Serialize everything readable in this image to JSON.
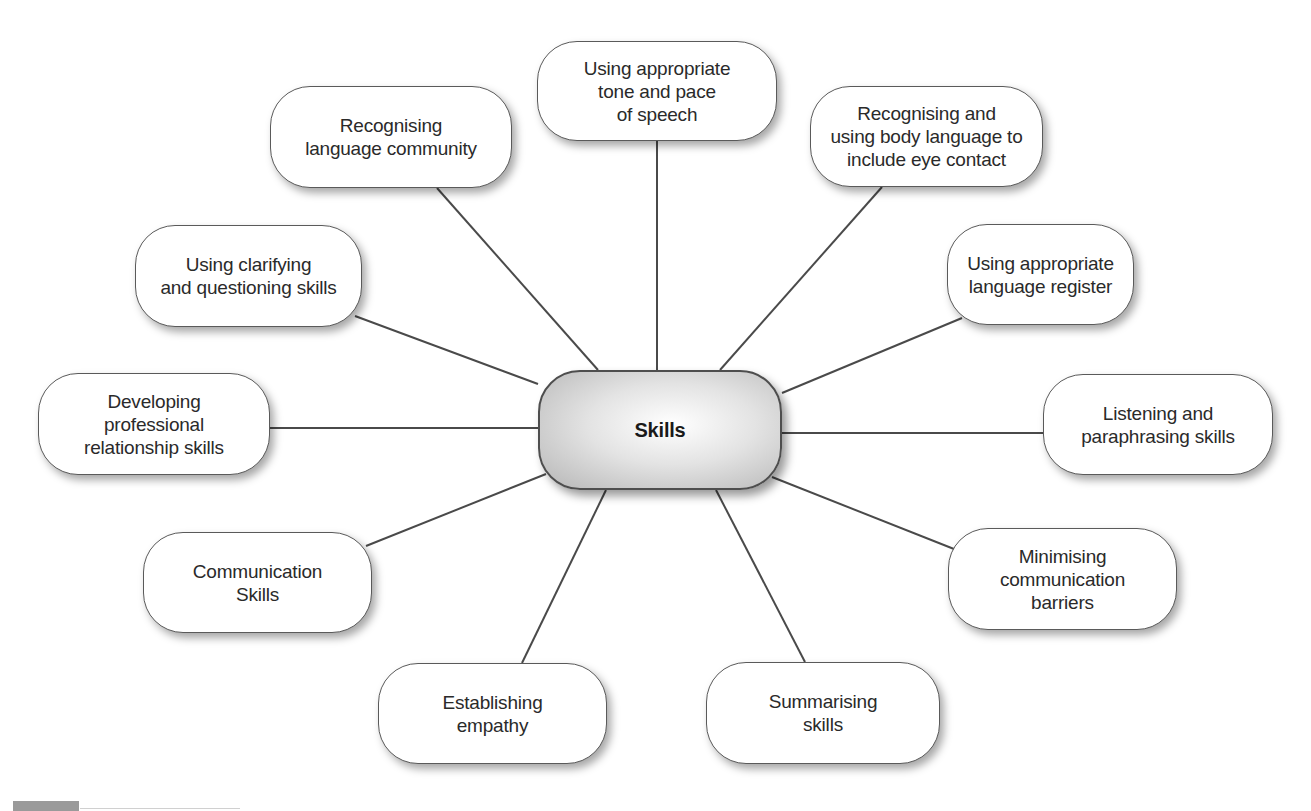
{
  "diagram": {
    "type": "mind-map",
    "center": {
      "label": "Skills",
      "box": [
        538,
        370,
        244,
        120
      ]
    },
    "nodes": [
      {
        "id": "tone-pace",
        "label": "Using appropriate\ntone and pace\nof speech",
        "box": [
          537,
          41,
          240,
          100
        ],
        "edge": [
          [
            657,
            141
          ],
          [
            657,
            370
          ]
        ]
      },
      {
        "id": "language-community",
        "label": "Recognising\nlanguage community",
        "box": [
          270,
          86,
          242,
          102
        ],
        "edge": [
          [
            437,
            188
          ],
          [
            598,
            370
          ]
        ]
      },
      {
        "id": "body-language",
        "label": "Recognising and\nusing body language to\ninclude eye contact",
        "box": [
          810,
          86,
          233,
          101
        ],
        "edge": [
          [
            882,
            187
          ],
          [
            720,
            370
          ]
        ]
      },
      {
        "id": "clarifying-questioning",
        "label": "Using clarifying\nand questioning skills",
        "box": [
          135,
          225,
          227,
          102
        ],
        "edge": [
          [
            355,
            316
          ],
          [
            538,
            384
          ]
        ]
      },
      {
        "id": "language-register",
        "label": "Using appropriate\nlanguage register",
        "box": [
          947,
          224,
          187,
          101
        ],
        "edge": [
          [
            962,
            318
          ],
          [
            782,
            393
          ]
        ]
      },
      {
        "id": "professional-relationship",
        "label": "Developing\nprofessional\nrelationship skills",
        "box": [
          38,
          373,
          232,
          102
        ],
        "edge": [
          [
            270,
            428
          ],
          [
            538,
            428
          ]
        ]
      },
      {
        "id": "listening-paraphrasing",
        "label": "Listening and\nparaphrasing skills",
        "box": [
          1043,
          374,
          230,
          101
        ],
        "edge": [
          [
            782,
            433
          ],
          [
            1043,
            433
          ]
        ]
      },
      {
        "id": "communication-skills",
        "label": "Communication\nSkills",
        "box": [
          143,
          532,
          229,
          101
        ],
        "edge": [
          [
            366,
            546
          ],
          [
            546,
            474
          ]
        ]
      },
      {
        "id": "communication-barriers",
        "label": "Minimising\ncommunication\nbarriers",
        "box": [
          948,
          528,
          229,
          102
        ],
        "edge": [
          [
            772,
            477
          ],
          [
            954,
            549
          ]
        ]
      },
      {
        "id": "empathy",
        "label": "Establishing\nempathy",
        "box": [
          378,
          663,
          229,
          101
        ],
        "edge": [
          [
            522,
            663
          ],
          [
            606,
            490
          ]
        ]
      },
      {
        "id": "summarising",
        "label": "Summarising\nskills",
        "box": [
          706,
          662,
          234,
          102
        ],
        "edge": [
          [
            805,
            662
          ],
          [
            716,
            490
          ]
        ]
      }
    ],
    "colors": {
      "line": "#4a4a4a",
      "node_border": "#5a5a5a",
      "node_fill": "#ffffff",
      "center_fill_light": "#ffffff",
      "center_fill_dark": "#b5b5b5",
      "text": "#2a2a2a"
    }
  }
}
